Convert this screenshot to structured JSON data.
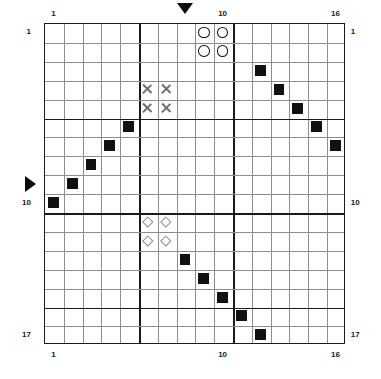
{
  "puzzle": {
    "title": "battleship-grid-puzzle",
    "grid": {
      "columns": 16,
      "rows": 17,
      "origin_x": 44,
      "origin_y": 23,
      "cell_w": 18.8,
      "cell_h": 18.9,
      "thick_columns": [
        5,
        10
      ],
      "thick_rows": [
        5,
        10,
        15
      ],
      "line_color": "#8d8d8d",
      "thick_line_color": "#1a1a1a"
    },
    "labels": {
      "top": [
        {
          "text": "1",
          "col": 1
        },
        {
          "text": "10",
          "col": 10
        },
        {
          "text": "16",
          "col": 16
        }
      ],
      "bottom": [
        {
          "text": "1",
          "col": 1
        },
        {
          "text": "10",
          "col": 10
        },
        {
          "text": "16",
          "col": 16
        }
      ],
      "left": [
        {
          "text": "1",
          "row": 1
        },
        {
          "text": "10",
          "row": 10
        },
        {
          "text": "17",
          "row": 17
        }
      ],
      "right": [
        {
          "text": "1",
          "row": 1
        },
        {
          "text": "10",
          "row": 10
        },
        {
          "text": "17",
          "row": 17
        }
      ]
    },
    "pointers": [
      {
        "name": "top-pointer",
        "direction": "down",
        "col": 8
      },
      {
        "name": "left-pointer",
        "direction": "right",
        "row": 9
      }
    ],
    "markers": {
      "circles": [
        {
          "row": 1,
          "col": 9
        },
        {
          "row": 1,
          "col": 10
        },
        {
          "row": 2,
          "col": 9
        },
        {
          "row": 2,
          "col": 10
        }
      ],
      "crosses": [
        {
          "row": 4,
          "col": 6
        },
        {
          "row": 4,
          "col": 7
        },
        {
          "row": 5,
          "col": 6
        },
        {
          "row": 5,
          "col": 7
        }
      ],
      "diamonds": [
        {
          "row": 11,
          "col": 6
        },
        {
          "row": 11,
          "col": 7
        },
        {
          "row": 12,
          "col": 6
        },
        {
          "row": 12,
          "col": 7
        }
      ],
      "squares": [
        {
          "row": 3,
          "col": 12
        },
        {
          "row": 4,
          "col": 13
        },
        {
          "row": 5,
          "col": 14
        },
        {
          "row": 6,
          "col": 15
        },
        {
          "row": 7,
          "col": 16
        },
        {
          "row": 6,
          "col": 5
        },
        {
          "row": 7,
          "col": 4
        },
        {
          "row": 8,
          "col": 3
        },
        {
          "row": 9,
          "col": 2
        },
        {
          "row": 10,
          "col": 1
        },
        {
          "row": 13,
          "col": 8
        },
        {
          "row": 14,
          "col": 9
        },
        {
          "row": 15,
          "col": 10
        },
        {
          "row": 16,
          "col": 11
        },
        {
          "row": 17,
          "col": 12
        }
      ]
    },
    "colors": {
      "square_fill": "#111111",
      "circle_stroke": "#111111",
      "cross_stroke": "#6f6f6f",
      "diamond_stroke": "#8a8a8a",
      "background": "#ffffff"
    }
  }
}
